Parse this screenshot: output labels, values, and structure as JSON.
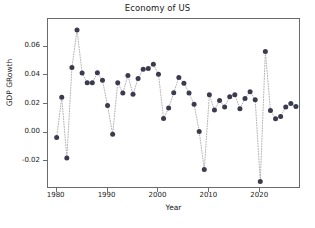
{
  "chart_data": {
    "type": "scatter",
    "title": "Economy of US",
    "xlabel": "Year",
    "ylabel": "GDP GRowth",
    "grid": false,
    "legend": null,
    "xlim": [
      1978.3,
      2028.0
    ],
    "ylim": [
      -0.0395,
      0.0795
    ],
    "xticks": [
      1980,
      1990,
      2000,
      2010,
      2020
    ],
    "xticklabels": [
      "1980",
      "1990",
      "2000",
      "2010",
      "2020"
    ],
    "yticks": [
      -0.02,
      0.0,
      0.02,
      0.04,
      0.06
    ],
    "yticklabels": [
      "-0.02",
      "0.00",
      "0.02",
      "0.04",
      "0.06"
    ],
    "marker": "circle",
    "marker_color": "#3b3b4f",
    "line_style": "dotted",
    "line_color": "#b0b0b0",
    "x": [
      1980,
      1981,
      1982,
      1983,
      1984,
      1985,
      1986,
      1987,
      1988,
      1989,
      1990,
      1991,
      1992,
      1993,
      1994,
      1995,
      1996,
      1997,
      1998,
      1999,
      2000,
      2001,
      2002,
      2003,
      2004,
      2005,
      2006,
      2007,
      2008,
      2009,
      2010,
      2011,
      2012,
      2013,
      2014,
      2015,
      2016,
      2017,
      2018,
      2019,
      2020,
      2021,
      2022,
      2023,
      2024,
      2025,
      2026,
      2027
    ],
    "y": [
      -0.0035,
      0.0248,
      -0.0178,
      0.0456,
      0.0718,
      0.0417,
      0.0348,
      0.0348,
      0.0418,
      0.0366,
      0.0189,
      -0.0011,
      0.0348,
      0.0277,
      0.0399,
      0.0269,
      0.0378,
      0.0444,
      0.0448,
      0.0478,
      0.0409,
      0.0099,
      0.0172,
      0.0279,
      0.0386,
      0.0346,
      0.0277,
      0.0199,
      0.0008,
      -0.0259,
      0.0264,
      0.0158,
      0.0224,
      0.0179,
      0.0251,
      0.0265,
      0.0167,
      0.0239,
      0.0286,
      0.0229,
      -0.0342,
      0.0567,
      0.0155,
      0.0097,
      0.0113,
      0.0179,
      0.0204,
      0.0182
    ]
  }
}
